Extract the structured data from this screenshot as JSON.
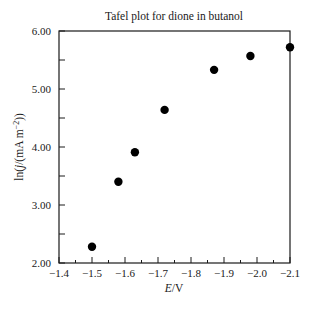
{
  "chart_data": {
    "type": "scatter",
    "title": "Tafel plot for dione in butanol",
    "xlabel": "E/V",
    "ylabel": "ln(j/(mA m^-2))",
    "xlim": [
      -1.4,
      -2.1
    ],
    "ylim": [
      2.0,
      6.0
    ],
    "x_axis_reversed": true,
    "grid": false,
    "legend": null,
    "x_ticks": [
      "-1.4",
      "-1.5",
      "-1.6",
      "-1.7",
      "-1.8",
      "-1.9",
      "-2.0",
      "-2.1"
    ],
    "x_tick_values": [
      -1.4,
      -1.5,
      -1.6,
      -1.7,
      -1.8,
      -1.9,
      -2.0,
      -2.1
    ],
    "y_ticks": [
      "2.00",
      "3.00",
      "4.00",
      "5.00",
      "6.00"
    ],
    "y_tick_values": [
      2.0,
      3.0,
      4.0,
      5.0,
      6.0
    ],
    "series": [
      {
        "name": "data",
        "marker": "filled-circle",
        "color": "#000000",
        "x": [
          -1.5,
          -1.58,
          -1.63,
          -1.72,
          -1.87,
          -1.98,
          -2.1
        ],
        "y": [
          2.28,
          3.4,
          3.91,
          4.64,
          5.33,
          5.57,
          5.72
        ]
      }
    ]
  },
  "labels": {
    "title": "Tafel plot for dione in butanol",
    "xlabel_var": "E",
    "xlabel_unit": "/V",
    "ylabel_pre": "ln(",
    "ylabel_var": "j",
    "ylabel_mid": "/(mA m",
    "ylabel_sup": "−2",
    "ylabel_post": "))"
  }
}
